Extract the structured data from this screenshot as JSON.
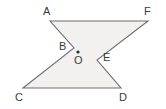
{
  "figure": {
    "name": "hexagon-with-center-point",
    "canvas": {
      "width": 166,
      "height": 109
    },
    "style": {
      "fill_color": "#f2f1ef",
      "stroke_color": "#6e6e6e",
      "stroke_width": 1.1,
      "background_color": "#ffffff",
      "label_color": "#3b3b3b",
      "point_color": "#2b2b2b"
    },
    "polygon_order": "A-F-E-D-C-B",
    "vertices": [
      {
        "id": "A",
        "label": "A",
        "x": 50,
        "y": 21,
        "label_x": 43,
        "label_y": 6
      },
      {
        "id": "F",
        "label": "F",
        "x": 148,
        "y": 21,
        "label_x": 144,
        "label_y": 6
      },
      {
        "id": "E",
        "label": "E",
        "x": 97,
        "y": 60,
        "label_x": 103,
        "label_y": 52
      },
      {
        "id": "D",
        "label": "D",
        "x": 121,
        "y": 88,
        "label_x": 119,
        "label_y": 92
      },
      {
        "id": "C",
        "label": "C",
        "x": 23,
        "y": 88,
        "label_x": 15,
        "label_y": 92
      },
      {
        "id": "B",
        "label": "B",
        "x": 74,
        "y": 48,
        "label_x": 59,
        "label_y": 41
      }
    ],
    "interior_point": {
      "id": "O",
      "label": "O",
      "x": 78,
      "y": 52,
      "radius": 1.6,
      "label_x": 74,
      "label_y": 55
    },
    "edges": [
      {
        "from": "A",
        "to": "F"
      },
      {
        "from": "F",
        "to": "E"
      },
      {
        "from": "E",
        "to": "D"
      },
      {
        "from": "D",
        "to": "C"
      },
      {
        "from": "C",
        "to": "B"
      },
      {
        "from": "B",
        "to": "A"
      }
    ]
  }
}
